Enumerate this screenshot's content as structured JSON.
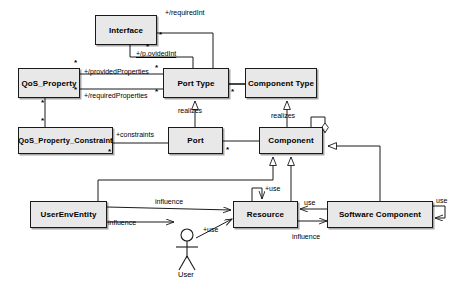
{
  "diagram": {
    "type": "uml-class-diagram",
    "canvas": {
      "width": 469,
      "height": 284,
      "background": "#ffffff"
    },
    "style": {
      "box_fill": "#e8e8e8",
      "box_stroke": "#1a1a1a",
      "line_color": "#1a1a1a",
      "text_color": "#000000"
    },
    "nodes": [
      {
        "id": "interface",
        "label": "Interface",
        "x": 95,
        "y": 15,
        "w": 62,
        "h": 30
      },
      {
        "id": "qos_property",
        "label": "QoS_Property",
        "x": 18,
        "y": 68,
        "w": 62,
        "h": 30
      },
      {
        "id": "port_type",
        "label": "Port Type",
        "x": 163,
        "y": 68,
        "w": 66,
        "h": 30
      },
      {
        "id": "component_type",
        "label": "Component Type",
        "x": 245,
        "y": 68,
        "w": 72,
        "h": 30
      },
      {
        "id": "qos_constraint",
        "label": "QoS_Property_Constraint",
        "x": 18,
        "y": 127,
        "w": 95,
        "h": 27
      },
      {
        "id": "port",
        "label": "Port",
        "x": 168,
        "y": 127,
        "w": 55,
        "h": 27
      },
      {
        "id": "component",
        "label": "Component",
        "x": 259,
        "y": 127,
        "w": 64,
        "h": 27
      },
      {
        "id": "userenventity",
        "label": "UserEnvEntity",
        "x": 30,
        "y": 201,
        "w": 77,
        "h": 27
      },
      {
        "id": "resource",
        "label": "Resource",
        "x": 233,
        "y": 201,
        "w": 65,
        "h": 27
      },
      {
        "id": "software_comp",
        "label": "Software Component",
        "x": 327,
        "y": 201,
        "w": 106,
        "h": 27
      }
    ],
    "actor": {
      "id": "user",
      "label": "User",
      "cx": 187,
      "cy": 243
    },
    "edge_labels": [
      {
        "id": "requiredint",
        "text": "+/requiredInt",
        "x": 165,
        "y": 9
      },
      {
        "id": "providedint",
        "text": "+/p.ovidedInt",
        "x": 136,
        "y": 50
      },
      {
        "id": "providedproperties",
        "text": "+/providedProperties",
        "x": 84,
        "y": 71
      },
      {
        "id": "requiredproperties",
        "text": "+/requiredProperties",
        "x": 84,
        "y": 95
      },
      {
        "id": "constraints",
        "text": "+constraints",
        "x": 115,
        "y": 131
      },
      {
        "id": "realizes-port",
        "text": "realizes",
        "x": 180,
        "y": 108
      },
      {
        "id": "realizes-component",
        "text": "realizes",
        "x": 273,
        "y": 113
      },
      {
        "id": "use-resource-self",
        "text": "+use",
        "x": 264,
        "y": 186
      },
      {
        "id": "influence-top",
        "text": "influence",
        "x": 156,
        "y": 198
      },
      {
        "id": "influence-left",
        "text": "influence",
        "x": 110,
        "y": 219
      },
      {
        "id": "use-user",
        "text": "+use",
        "x": 207,
        "y": 226
      },
      {
        "id": "use-sw-to-res",
        "text": "use",
        "x": 305,
        "y": 200
      },
      {
        "id": "influence-bottom",
        "text": "influence",
        "x": 296,
        "y": 234
      },
      {
        "id": "use-sw-self",
        "text": "use",
        "x": 438,
        "y": 199
      }
    ],
    "multiplicities": [
      {
        "id": "m-interface-right",
        "text": "*",
        "x": 158,
        "y": 36
      },
      {
        "id": "m-interface-bottom",
        "text": "*",
        "x": 146,
        "y": 45
      },
      {
        "id": "m-qos-tr",
        "text": "*",
        "x": 75,
        "y": 61
      },
      {
        "id": "m-qos-br",
        "text": "*",
        "x": 75,
        "y": 88
      },
      {
        "id": "m-qos-bottom",
        "text": "*",
        "x": 45,
        "y": 95
      },
      {
        "id": "m-porttype-left",
        "text": "*",
        "x": 155,
        "y": 68
      },
      {
        "id": "m-porttype-left2",
        "text": "*",
        "x": 155,
        "y": 92
      },
      {
        "id": "m-porttype-right",
        "text": "*",
        "x": 231,
        "y": 90
      },
      {
        "id": "m-qosc-top",
        "text": "*",
        "x": 45,
        "y": 118
      },
      {
        "id": "m-qosc-br",
        "text": "*",
        "x": 107,
        "y": 148
      },
      {
        "id": "m-port-right",
        "text": "*",
        "x": 225,
        "y": 146
      }
    ]
  }
}
